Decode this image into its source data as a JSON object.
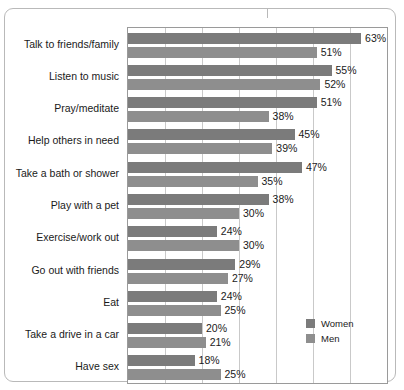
{
  "chart_data": {
    "type": "bar",
    "orientation": "horizontal",
    "title": "",
    "xlabel": "",
    "ylabel": "",
    "xlim": [
      0,
      70
    ],
    "grid": true,
    "grid_step": 10,
    "legend_position": "inside-right",
    "categories": [
      "Talk to friends/family",
      "Listen to music",
      "Pray/meditate",
      "Help others in need",
      "Take a bath or shower",
      "Play with a pet",
      "Exercise/work out",
      "Go out with friends",
      "Eat",
      "Take a drive in a car",
      "Have sex"
    ],
    "series": [
      {
        "name": "Women",
        "color": "#7b7b7b",
        "values": [
          63,
          55,
          51,
          45,
          47,
          38,
          24,
          29,
          24,
          20,
          18
        ],
        "labels": [
          "63%",
          "55%",
          "51%",
          "45%",
          "47%",
          "38%",
          "24%",
          "29%",
          "24%",
          "20%",
          "18%"
        ]
      },
      {
        "name": "Men",
        "color": "#8e8e8e",
        "values": [
          51,
          52,
          38,
          39,
          35,
          30,
          30,
          27,
          25,
          21,
          25
        ],
        "labels": [
          "51%",
          "52%",
          "38%",
          "39%",
          "35%",
          "30%",
          "30%",
          "27%",
          "25%",
          "21%",
          "25%"
        ]
      }
    ]
  },
  "legend": {
    "items": [
      {
        "label": "Women",
        "color": "#7b7b7b"
      },
      {
        "label": "Men",
        "color": "#8e8e8e"
      }
    ]
  }
}
